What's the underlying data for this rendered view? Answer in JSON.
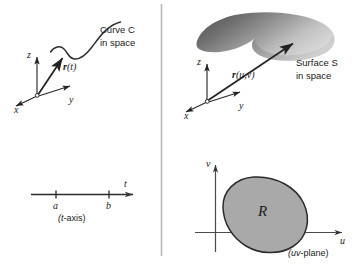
{
  "figure": {
    "title_alt": "Parametrization of a curve in space and a surface in space",
    "divider": {
      "name": "vertical-divider",
      "color": "#b5b5b5"
    },
    "panels": {
      "curve_space": {
        "caption_line1": "Curve C",
        "caption_line2": "in space",
        "vector_label": "r(t)",
        "axes": {
          "x": "x",
          "y": "y",
          "z": "z"
        }
      },
      "t_axis": {
        "endpoint_left": "a",
        "endpoint_right": "b",
        "axis_arrow_label": "t",
        "caption": "(t-axis)"
      },
      "surface_space": {
        "caption_line1": "Surface S",
        "caption_line2": "in space",
        "vector_label": "r(u,v)",
        "axes": {
          "x": "x",
          "y": "y",
          "z": "z"
        },
        "surface_fill_dark": "#555555",
        "surface_fill_light": "#d3d3d3"
      },
      "uv_plane": {
        "region_label": "R",
        "axis_u": "u",
        "axis_v": "v",
        "caption": "(uv-plane)",
        "region_fill": "#a8a8a8",
        "region_stroke": "#2b2b2b"
      }
    }
  }
}
